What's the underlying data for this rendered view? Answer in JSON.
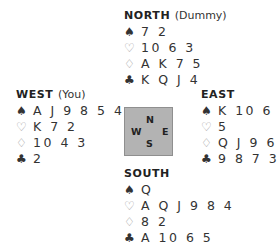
{
  "hands": {
    "north": {
      "label": "NORTH",
      "role": "(Dummy)",
      "spades": "7 2",
      "hearts": "10 6 3",
      "diamonds": "A K 7 5",
      "clubs": "K Q J 4"
    },
    "west": {
      "label": "WEST",
      "role": "(You)",
      "spades": "A J 9 8 5 4",
      "hearts": "K 7 2",
      "diamonds": "10 4 3",
      "clubs": "2"
    },
    "east": {
      "label": "EAST",
      "role": "",
      "spades": "K 10 6 3",
      "hearts": "5",
      "diamonds": "Q J 9 6",
      "clubs": "9 8 7 3"
    },
    "south": {
      "label": "SOUTH",
      "role": "",
      "spades": "Q",
      "hearts": "A Q J 9 8 4",
      "diamonds": "8 2",
      "clubs": "A 10 6 5"
    }
  },
  "suits": {
    "spades": "♠",
    "hearts": "♡",
    "diamonds": "♢",
    "clubs": "♣"
  },
  "compass": {
    "n": "N",
    "w": "W",
    "e": "E",
    "s": "S"
  }
}
